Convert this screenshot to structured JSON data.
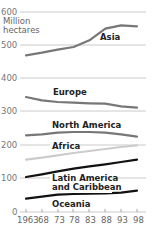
{
  "chart_data": {
    "type": "line",
    "title": "",
    "ylabel": "Million hectares",
    "xlabel": "",
    "ylim": [
      0,
      600
    ],
    "yticks": [
      0,
      100,
      200,
      300,
      400,
      500,
      600
    ],
    "x": [
      1963,
      1968,
      1973,
      1978,
      1983,
      1988,
      1993,
      1998
    ],
    "xtick_labels": [
      "1963",
      "68",
      "73",
      "78",
      "83",
      "88",
      "93",
      "98"
    ],
    "grid": true,
    "legend": "inline labels",
    "series": [
      {
        "name": "Asia",
        "color": "#777777",
        "values": [
          470,
          478,
          487,
          495,
          515,
          550,
          560,
          557
        ]
      },
      {
        "name": "Europe",
        "color": "#777777",
        "values": [
          345,
          335,
          330,
          328,
          326,
          325,
          317,
          313
        ]
      },
      {
        "name": "North America",
        "color": "#777777",
        "values": [
          230,
          233,
          238,
          240,
          240,
          238,
          233,
          226
        ]
      },
      {
        "name": "Africa",
        "color": "#cccccc",
        "values": [
          157,
          163,
          170,
          177,
          183,
          189,
          195,
          200
        ]
      },
      {
        "name": "Latin America and Caribbean",
        "color": "#111111",
        "values": [
          105,
          113,
          122,
          130,
          137,
          143,
          150,
          157
        ]
      },
      {
        "name": "Oceania",
        "color": "#111111",
        "values": [
          40,
          46,
          52,
          54,
          55,
          56,
          58,
          64
        ]
      }
    ]
  },
  "labels": {
    "unit_line1": "Million",
    "unit_line2": "hectares",
    "asia": "Asia",
    "europe": "Europe",
    "north_america": "North America",
    "africa": "Africa",
    "latin_america_line1": "Latin America",
    "latin_america_line2": "and Caribbean",
    "oceania": "Oceania"
  },
  "yaxis": [
    "600",
    "500",
    "400",
    "300",
    "200",
    "100",
    "0"
  ],
  "xaxis": [
    "1963",
    "68",
    "73",
    "78",
    "83",
    "88",
    "93",
    "98"
  ]
}
